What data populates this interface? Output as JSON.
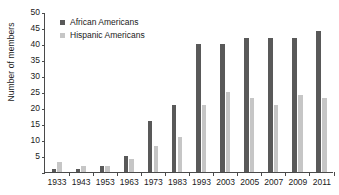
{
  "chart_data": {
    "type": "bar",
    "title": "",
    "xlabel": "",
    "ylabel": "Number of members",
    "ylim": [
      0,
      50
    ],
    "ytick_step": 5,
    "yticks": [
      0,
      5,
      10,
      15,
      20,
      25,
      30,
      35,
      40,
      45,
      50
    ],
    "ytick_labels": [
      "",
      "5",
      "10",
      "15",
      "20",
      "25",
      "30",
      "35",
      "40",
      "45",
      "50"
    ],
    "grid": false,
    "legend_position": "top-left",
    "categories": [
      "1933",
      "1943",
      "1953",
      "1963",
      "1973",
      "1983",
      "1993",
      "2003",
      "2005",
      "2007",
      "2009",
      "2011"
    ],
    "series": [
      {
        "name": "African Americans",
        "color": "#595959",
        "values": [
          1,
          1,
          2,
          5,
          16,
          21,
          40,
          40,
          42,
          42,
          42,
          44
        ]
      },
      {
        "name": "Hispanic Americans",
        "color": "#c6c6c6",
        "values": [
          3,
          2,
          2,
          4,
          8,
          11,
          21,
          25,
          23,
          21,
          24,
          23
        ]
      }
    ]
  },
  "axis": {
    "y_title": "Number of members"
  },
  "legend": {
    "entries": [
      {
        "label": "African Americans",
        "color": "#595959"
      },
      {
        "label": "Hispanic Americans",
        "color": "#c6c6c6"
      }
    ]
  }
}
